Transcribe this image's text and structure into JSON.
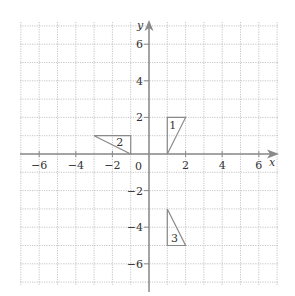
{
  "diagram": {
    "type": "coordinate-grid",
    "x_axis": {
      "label": "x",
      "min": -7,
      "max": 7,
      "ticks": [
        -6,
        -4,
        -2,
        2,
        4,
        6
      ],
      "tick_labels": [
        "−6",
        "−4",
        "−2",
        "2",
        "4",
        "6"
      ]
    },
    "y_axis": {
      "label": "y",
      "min": -7,
      "max": 7,
      "ticks": [
        6,
        4,
        2,
        -2,
        -4,
        -6
      ],
      "tick_labels": [
        "6",
        "4",
        "2",
        "−2",
        "−4",
        "−6"
      ]
    },
    "origin_label": "0",
    "triangles": [
      {
        "id": "1",
        "label": "1",
        "vertices": [
          [
            1,
            0
          ],
          [
            1,
            2
          ],
          [
            2,
            2
          ]
        ],
        "label_pos": [
          1.3,
          1.6
        ]
      },
      {
        "id": "2",
        "label": "2",
        "vertices": [
          [
            -3,
            1
          ],
          [
            -1,
            1
          ],
          [
            -1,
            0
          ]
        ],
        "label_pos": [
          -1.6,
          0.65
        ]
      },
      {
        "id": "3",
        "label": "3",
        "vertices": [
          [
            1,
            -3
          ],
          [
            1,
            -5
          ],
          [
            2,
            -5
          ]
        ],
        "label_pos": [
          1.4,
          -4.6
        ]
      }
    ],
    "colors": {
      "grid": "#b8b8b8",
      "axis": "#8a8a8a",
      "shape": "#8a8a8a",
      "text": "#333333"
    }
  }
}
